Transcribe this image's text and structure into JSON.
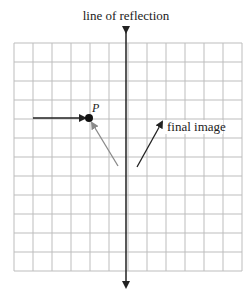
{
  "title": "line of reflection",
  "grid": {
    "cols": 12,
    "rows": 12,
    "x0": 14,
    "y0": 43,
    "cell": 19,
    "line_color": "#bdbdbd"
  },
  "axis": {
    "x": 126,
    "y_top": 27,
    "y_bottom": 292,
    "color": "#222222"
  },
  "point": {
    "label": "P",
    "x": 89,
    "y": 118
  },
  "arrows": [
    {
      "name": "incoming-arrow",
      "x1": 33,
      "y1": 118,
      "x2": 85,
      "y2": 118,
      "color": "#222222"
    },
    {
      "name": "reflected-arrow",
      "x1": 118,
      "y1": 166,
      "x2": 92,
      "y2": 123,
      "color": "#8a8a8a"
    },
    {
      "name": "final-image-arrow",
      "x1": 137,
      "y1": 167,
      "x2": 162,
      "y2": 122,
      "color": "#222222"
    }
  ],
  "final_label": "final image"
}
